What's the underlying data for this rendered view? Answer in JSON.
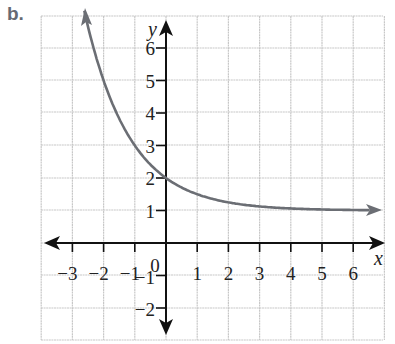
{
  "panel_label": "b.",
  "chart_data": {
    "type": "line",
    "title": "",
    "panel_label": "b.",
    "xlabel": "x",
    "ylabel": "y",
    "xlim": [
      -4,
      7
    ],
    "ylim": [
      -3,
      7
    ],
    "grid": true,
    "x_ticks": [
      -3,
      -2,
      -1,
      1,
      2,
      3,
      4,
      5,
      6
    ],
    "y_ticks": [
      -2,
      -1,
      1,
      2,
      3,
      4,
      5,
      6
    ],
    "x_tick_labels": [
      "−3",
      "−2",
      "−1",
      "1",
      "2",
      "3",
      "4",
      "5",
      "6"
    ],
    "y_tick_labels": [
      "−2",
      "−1",
      "1",
      "2",
      "3",
      "4",
      "5",
      "6"
    ],
    "origin_label": "0",
    "function": "y = 2^(-x) + 1",
    "asymptote": "y = 1",
    "series": [
      {
        "name": "y = 2^(-x) + 1",
        "x": [
          -2.6,
          -2,
          -1.5,
          -1,
          -0.5,
          0,
          0.5,
          1,
          1.5,
          2,
          3,
          4,
          5,
          6,
          6.7
        ],
        "y": [
          7.06,
          5,
          3.83,
          3,
          2.41,
          2,
          1.71,
          1.5,
          1.35,
          1.25,
          1.125,
          1.06,
          1.03,
          1.02,
          1.01
        ]
      }
    ],
    "arrows": {
      "curve_left": true,
      "curve_right": true,
      "x_axis_both": true,
      "y_axis_both": true
    },
    "colors": {
      "curve": "#6b6e74",
      "axes": "#111111",
      "grid": "#c8c8c8"
    }
  }
}
